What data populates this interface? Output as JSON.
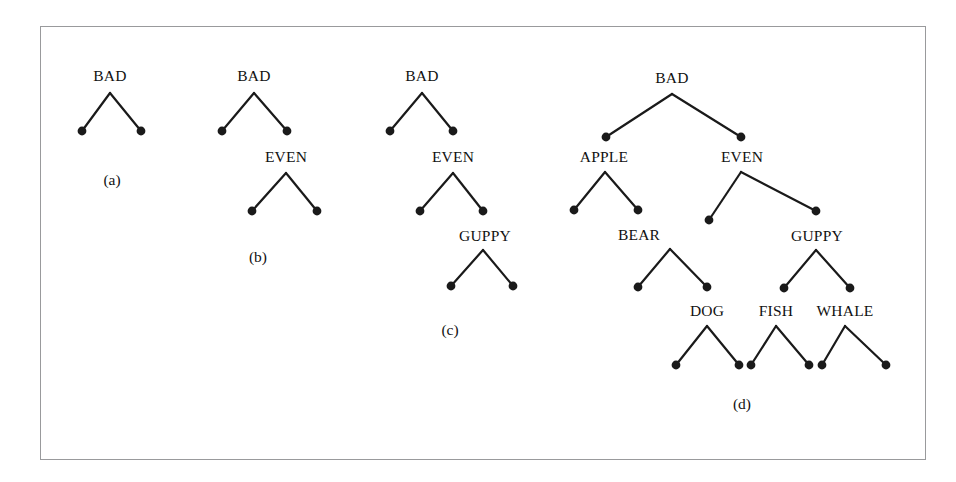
{
  "figure": {
    "kind": "derivation-tree-sequence",
    "panel_count": 4,
    "frame": {
      "x": 40,
      "y": 26,
      "width": 886,
      "height": 434,
      "border_color": "#999a9c"
    },
    "background_color": "#ffffff",
    "ink_color": "#1a1a1a",
    "panels": [
      {
        "id": "a",
        "caption": "(a)",
        "caption_x": 112,
        "caption_y": 180,
        "labels": [
          {
            "text": "BAD",
            "x": 110,
            "y": 76
          }
        ],
        "edges": [
          {
            "from": [
              110,
              93
            ],
            "to": [
              82,
              131
            ]
          },
          {
            "from": [
              110,
              93
            ],
            "to": [
              141,
              131
            ]
          }
        ],
        "dots": [
          {
            "x": 82,
            "y": 131
          },
          {
            "x": 141,
            "y": 131
          }
        ]
      },
      {
        "id": "b",
        "caption": "(b)",
        "caption_x": 258,
        "caption_y": 257,
        "labels": [
          {
            "text": "BAD",
            "x": 254,
            "y": 76
          },
          {
            "text": "EVEN",
            "x": 286,
            "y": 157
          }
        ],
        "edges": [
          {
            "from": [
              254,
              93
            ],
            "to": [
              222,
              131
            ]
          },
          {
            "from": [
              254,
              93
            ],
            "to": [
              287,
              131
            ]
          },
          {
            "from": [
              286,
              173
            ],
            "to": [
              252,
              211
            ]
          },
          {
            "from": [
              286,
              173
            ],
            "to": [
              317,
              211
            ]
          }
        ],
        "dots": [
          {
            "x": 222,
            "y": 131
          },
          {
            "x": 287,
            "y": 131
          },
          {
            "x": 252,
            "y": 211
          },
          {
            "x": 317,
            "y": 211
          }
        ]
      },
      {
        "id": "c",
        "caption": "(c)",
        "caption_x": 450,
        "caption_y": 330,
        "labels": [
          {
            "text": "BAD",
            "x": 422,
            "y": 76
          },
          {
            "text": "EVEN",
            "x": 453,
            "y": 157
          },
          {
            "text": "GUPPY",
            "x": 485,
            "y": 236
          }
        ],
        "edges": [
          {
            "from": [
              422,
              93
            ],
            "to": [
              390,
              131
            ]
          },
          {
            "from": [
              422,
              93
            ],
            "to": [
              453,
              131
            ]
          },
          {
            "from": [
              453,
              173
            ],
            "to": [
              420,
              211
            ]
          },
          {
            "from": [
              453,
              173
            ],
            "to": [
              483,
              211
            ]
          },
          {
            "from": [
              483,
              250
            ],
            "to": [
              451,
              286
            ]
          },
          {
            "from": [
              483,
              250
            ],
            "to": [
              513,
              286
            ]
          }
        ],
        "dots": [
          {
            "x": 390,
            "y": 131
          },
          {
            "x": 453,
            "y": 131
          },
          {
            "x": 420,
            "y": 211
          },
          {
            "x": 483,
            "y": 211
          },
          {
            "x": 451,
            "y": 286
          },
          {
            "x": 513,
            "y": 286
          }
        ]
      },
      {
        "id": "d",
        "caption": "(d)",
        "caption_x": 742,
        "caption_y": 404,
        "labels": [
          {
            "text": "BAD",
            "x": 672,
            "y": 78
          },
          {
            "text": "APPLE",
            "x": 604,
            "y": 157
          },
          {
            "text": "EVEN",
            "x": 742,
            "y": 157
          },
          {
            "text": "BEAR",
            "x": 639,
            "y": 235
          },
          {
            "text": "GUPPY",
            "x": 817,
            "y": 236
          },
          {
            "text": "DOG",
            "x": 707,
            "y": 311
          },
          {
            "text": "FISH",
            "x": 776,
            "y": 311
          },
          {
            "text": "WHALE",
            "x": 845,
            "y": 311
          }
        ],
        "edges": [
          {
            "from": [
              672,
              94
            ],
            "to": [
              606,
              137
            ]
          },
          {
            "from": [
              672,
              94
            ],
            "to": [
              741,
              137
            ]
          },
          {
            "from": [
              605,
              172
            ],
            "to": [
              574,
              210
            ]
          },
          {
            "from": [
              605,
              172
            ],
            "to": [
              638,
              210
            ]
          },
          {
            "from": [
              741,
              172
            ],
            "to": [
              709,
              220
            ]
          },
          {
            "from": [
              741,
              172
            ],
            "to": [
              816,
              211
            ]
          },
          {
            "from": [
              670,
              249
            ],
            "to": [
              638,
              287
            ]
          },
          {
            "from": [
              670,
              249
            ],
            "to": [
              707,
              287
            ]
          },
          {
            "from": [
              816,
              250
            ],
            "to": [
              784,
              288
            ]
          },
          {
            "from": [
              816,
              250
            ],
            "to": [
              850,
              288
            ]
          },
          {
            "from": [
              707,
              326
            ],
            "to": [
              676,
              365
            ]
          },
          {
            "from": [
              707,
              326
            ],
            "to": [
              739,
              365
            ]
          },
          {
            "from": [
              776,
              326
            ],
            "to": [
              751,
              365
            ]
          },
          {
            "from": [
              776,
              326
            ],
            "to": [
              809,
              365
            ]
          },
          {
            "from": [
              845,
              326
            ],
            "to": [
              822,
              365
            ]
          },
          {
            "from": [
              845,
              326
            ],
            "to": [
              886,
              365
            ]
          }
        ],
        "dots": [
          {
            "x": 606,
            "y": 137
          },
          {
            "x": 741,
            "y": 137
          },
          {
            "x": 574,
            "y": 210
          },
          {
            "x": 638,
            "y": 210
          },
          {
            "x": 709,
            "y": 220
          },
          {
            "x": 816,
            "y": 211
          },
          {
            "x": 638,
            "y": 287
          },
          {
            "x": 707,
            "y": 287
          },
          {
            "x": 784,
            "y": 288
          },
          {
            "x": 850,
            "y": 288
          },
          {
            "x": 676,
            "y": 365
          },
          {
            "x": 739,
            "y": 365
          },
          {
            "x": 751,
            "y": 365
          },
          {
            "x": 809,
            "y": 365
          },
          {
            "x": 822,
            "y": 365
          },
          {
            "x": 886,
            "y": 365
          }
        ]
      }
    ]
  }
}
